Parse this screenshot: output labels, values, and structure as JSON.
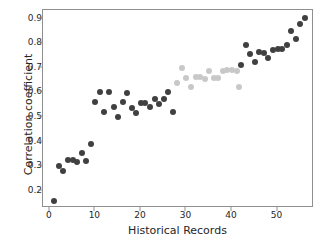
{
  "chart_data": {
    "type": "scatter",
    "title": "",
    "xlabel": "Historical Records",
    "ylabel": "Correlation coefficient",
    "xlim": [
      -1.5,
      58
    ],
    "ylim": [
      0.13,
      0.935
    ],
    "xticks": [
      0,
      10,
      20,
      30,
      40,
      50
    ],
    "yticks": [
      0.2,
      0.3,
      0.4,
      0.5,
      0.6,
      0.7,
      0.8,
      0.9
    ],
    "xtick_labels": [
      "0",
      "10",
      "20",
      "30",
      "40",
      "50"
    ],
    "ytick_labels": [
      "0.2",
      "0.3",
      "0.4",
      "0.5",
      "0.6",
      "0.7",
      "0.8",
      "0.9"
    ],
    "grid": false,
    "legend": null,
    "marker": "circle",
    "marker_size": 6,
    "colors": {
      "dark": "#404040",
      "light": "#c8c8c8"
    },
    "series": [
      {
        "name": "dark-points",
        "color": "#404040",
        "points": [
          [
            1,
            0.158
          ],
          [
            2,
            0.301
          ],
          [
            3,
            0.279
          ],
          [
            4,
            0.325
          ],
          [
            5,
            0.326
          ],
          [
            6,
            0.318
          ],
          [
            7,
            0.355
          ],
          [
            8,
            0.322
          ],
          [
            9,
            0.391
          ],
          [
            10,
            0.562
          ],
          [
            11,
            0.602
          ],
          [
            12,
            0.522
          ],
          [
            13,
            0.603
          ],
          [
            14,
            0.541
          ],
          [
            15,
            0.5
          ],
          [
            16,
            0.56
          ],
          [
            17,
            0.599
          ],
          [
            18,
            0.536
          ],
          [
            19,
            0.518
          ],
          [
            20,
            0.556
          ],
          [
            21,
            0.558
          ],
          [
            22,
            0.54
          ],
          [
            23,
            0.573
          ],
          [
            24,
            0.551
          ],
          [
            25,
            0.573
          ],
          [
            26,
            0.6
          ],
          [
            27,
            0.522
          ],
          [
            42,
            0.71
          ],
          [
            43,
            0.791
          ],
          [
            44,
            0.755
          ],
          [
            45,
            0.724
          ],
          [
            46,
            0.765
          ],
          [
            47,
            0.762
          ],
          [
            48,
            0.74
          ],
          [
            49,
            0.772
          ],
          [
            50,
            0.777
          ],
          [
            51,
            0.775
          ],
          [
            52,
            0.793
          ],
          [
            53,
            0.848
          ],
          [
            54,
            0.818
          ],
          [
            55,
            0.88
          ],
          [
            56,
            0.903
          ]
        ]
      },
      {
        "name": "light-points",
        "color": "#c8c8c8",
        "points": [
          [
            28,
            0.64
          ],
          [
            29,
            0.699
          ],
          [
            30,
            0.658
          ],
          [
            31,
            0.623
          ],
          [
            32,
            0.662
          ],
          [
            33,
            0.661
          ],
          [
            34,
            0.655
          ],
          [
            35,
            0.687
          ],
          [
            36,
            0.657
          ],
          [
            37,
            0.658
          ],
          [
            38,
            0.689
          ],
          [
            39,
            0.69
          ],
          [
            40,
            0.69
          ],
          [
            41,
            0.689
          ],
          [
            41.5,
            0.623
          ]
        ]
      }
    ]
  }
}
